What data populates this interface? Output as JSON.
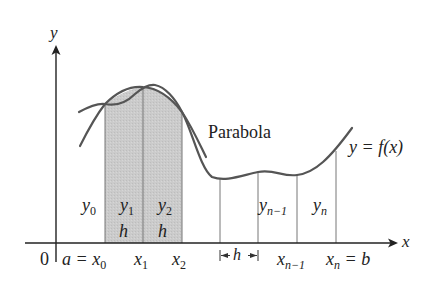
{
  "diagram": {
    "axes": {
      "x_label": "x",
      "y_label": "y",
      "origin_label": "0"
    },
    "curve_label": "y = f(x)",
    "parabola_label": "Parabola",
    "interval_labels": {
      "a_eq": "a =",
      "x0": "x",
      "x0_sub": "0",
      "x1": "x",
      "x1_sub": "1",
      "x2": "x",
      "x2_sub": "2",
      "xn1": "x",
      "xn1_sub": "n−1",
      "xn": "x",
      "xn_sub": "n",
      "eq_b": "= b"
    },
    "ordinate_labels": {
      "y0": "y",
      "y0_sub": "0",
      "y1": "y",
      "y1_sub": "1",
      "y2": "y",
      "y2_sub": "2",
      "yn1": "y",
      "yn1_sub": "n−1",
      "yn": "y",
      "yn_sub": "n"
    },
    "width_labels": {
      "h1": "h",
      "h2": "h",
      "h_bracket": "h"
    },
    "colors": {
      "shade": "#c8c8c8",
      "curve": "#555555",
      "axis": "#222222",
      "lines": "#777777"
    }
  }
}
